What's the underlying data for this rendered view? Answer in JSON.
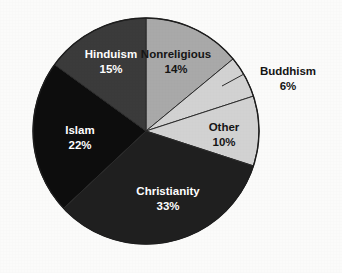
{
  "chart_data": {
    "type": "pie",
    "title": "",
    "subtitle": "",
    "xlabel": "",
    "ylabel": "",
    "legend_position": "none",
    "grid": false,
    "labels_inside_slices": true,
    "start_angle_clock": "12 o'clock",
    "direction": "clockwise",
    "categories": [
      "Nonreligious",
      "Buddhism",
      "Other",
      "Christianity",
      "Islam",
      "Hinduism"
    ],
    "values": [
      14,
      6,
      10,
      33,
      22,
      15
    ],
    "unit": "%",
    "total": 100,
    "slices": [
      {
        "label": "Nonreligious",
        "value": 14,
        "value_text": "14%",
        "color": "#a9a9a9",
        "text_color": "#151515",
        "label_placement": "inside",
        "start_deg": 0,
        "end_deg": 50.4
      },
      {
        "label": "Buddhism",
        "value": 6,
        "value_text": "6%",
        "color": "#d2d2d2",
        "text_color": "#151515",
        "label_placement": "outside",
        "start_deg": 50.4,
        "end_deg": 72
      },
      {
        "label": "Other",
        "value": 10,
        "value_text": "10%",
        "color": "#d2d2d2",
        "text_color": "#151515",
        "label_placement": "inside",
        "start_deg": 72,
        "end_deg": 108
      },
      {
        "label": "Christianity",
        "value": 33,
        "value_text": "33%",
        "color": "#1f1f1f",
        "text_color": "#ffffff",
        "label_placement": "inside",
        "start_deg": 108,
        "end_deg": 226.8
      },
      {
        "label": "Islam",
        "value": 22,
        "value_text": "22%",
        "color": "#0d0d0d",
        "text_color": "#ffffff",
        "label_placement": "inside",
        "start_deg": 226.8,
        "end_deg": 306
      },
      {
        "label": "Hinduism",
        "value": 15,
        "value_text": "15%",
        "color": "#3b3b3b",
        "text_color": "#ffffff",
        "label_placement": "inside",
        "start_deg": 306,
        "end_deg": 360
      }
    ],
    "colors": {
      "background": "#fbfbfa",
      "slice_outline": "#2b2b2b",
      "nonreligious": "#a9a9a9",
      "buddhism": "#d2d2d2",
      "other": "#d2d2d2",
      "christianity": "#1f1f1f",
      "islam": "#0d0d0d",
      "hinduism": "#3b3b3b"
    },
    "geometry": {
      "center_x": 146,
      "center_y": 131,
      "radius": 113
    }
  },
  "labels": {
    "nonreligious": {
      "name": "Nonreligious",
      "value": "14%"
    },
    "buddhism": {
      "name": "Buddhism",
      "value": "6%"
    },
    "other": {
      "name": "Other",
      "value": "10%"
    },
    "christianity": {
      "name": "Christianity",
      "value": "33%"
    },
    "islam": {
      "name": "Islam",
      "value": "22%"
    },
    "hinduism": {
      "name": "Hinduism",
      "value": "15%"
    }
  }
}
